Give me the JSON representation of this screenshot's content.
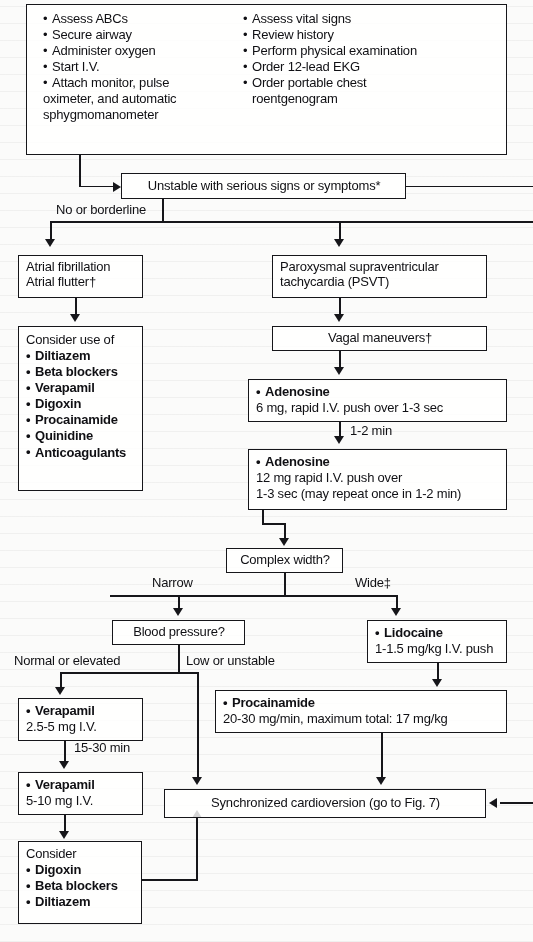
{
  "figure": {
    "type": "clinical-algorithm-flowchart",
    "ink_color": "#16161a",
    "paper_color": "#fbfbfa"
  },
  "nodes": {
    "initial_assessment": {
      "name": "initial-assessment",
      "left_column": [
        "Assess ABCs",
        "Secure airway",
        "Administer oxygen",
        "Start I.V.",
        "Attach monitor, pulse"
      ],
      "left_column_continuation": [
        "oximeter, and automatic",
        "sphygmomanometer"
      ],
      "right_column": [
        "Assess vital signs",
        "Review history",
        "Perform physical examination",
        "Order 12-lead EKG",
        "Order portable chest"
      ],
      "right_column_continuation": [
        "roentgenogram"
      ]
    },
    "unstable": {
      "name": "unstable-decision",
      "text": "Unstable with serious signs or symptoms*"
    },
    "atrial": {
      "name": "atrial-fibrillation-flutter",
      "lines": [
        "Atrial fibrillation",
        "Atrial flutter†"
      ]
    },
    "psvt": {
      "name": "psvt",
      "lines": [
        "Paroxysmal supraventricular",
        "tachycardia (PSVT)"
      ]
    },
    "consider_use_of": {
      "name": "consider-use-of-drugs",
      "heading": "Consider use of",
      "drugs": [
        "Diltiazem",
        "Beta blockers",
        "Verapamil",
        "Digoxin",
        "Procainamide",
        "Quinidine",
        "Anticoagulants"
      ]
    },
    "vagal": {
      "name": "vagal-maneuvers",
      "text": "Vagal maneuvers†"
    },
    "adenosine_6": {
      "name": "adenosine-6mg",
      "drug": "Adenosine",
      "dose": "6 mg, rapid I.V. push over 1-3 sec"
    },
    "adenosine_12": {
      "name": "adenosine-12mg",
      "drug": "Adenosine",
      "dose_line1": "12 mg rapid I.V. push over",
      "dose_line2": "1-3 sec (may repeat once in 1-2 min)"
    },
    "complex_width": {
      "name": "complex-width-decision",
      "text": "Complex width?"
    },
    "blood_pressure": {
      "name": "blood-pressure-decision",
      "text": "Blood pressure?"
    },
    "lidocaine": {
      "name": "lidocaine",
      "drug": "Lidocaine",
      "dose": "1-1.5 mg/kg I.V. push"
    },
    "procainamide": {
      "name": "procainamide",
      "drug": "Procainamide",
      "dose": "20-30 mg/min, maximum total: 17 mg/kg"
    },
    "verapamil_1": {
      "name": "verapamil-2point5-5mg",
      "drug": "Verapamil",
      "dose": "2.5-5 mg I.V."
    },
    "verapamil_2": {
      "name": "verapamil-5-10mg",
      "drug": "Verapamil",
      "dose": "5-10 mg I.V."
    },
    "consider_bottom": {
      "name": "consider-drugs-bottom",
      "heading": "Consider",
      "drugs": [
        "Digoxin",
        "Beta blockers",
        "Diltiazem"
      ]
    },
    "cardioversion": {
      "name": "synchronized-cardioversion",
      "text": "Synchronized cardioversion (go to Fig. 7)"
    }
  },
  "edge_labels": {
    "no_or_borderline": "No or borderline",
    "interval_1_2_min": "1-2 min",
    "narrow": "Narrow",
    "wide": "Wide‡",
    "normal_or_elevated": "Normal or elevated",
    "low_or_unstable": "Low or unstable",
    "interval_15_30_min": "15-30 min"
  }
}
